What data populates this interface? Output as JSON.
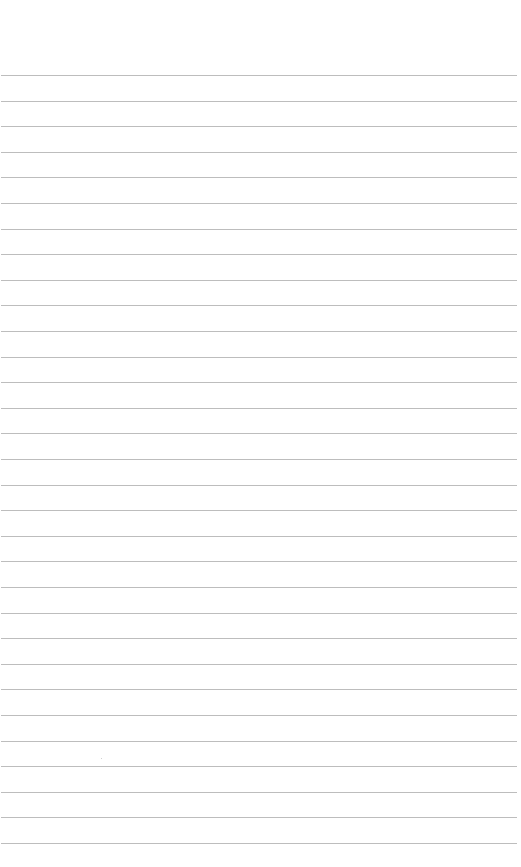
{
  "page": {
    "type": "lined-paper",
    "background_color": "#ffffff",
    "rule_color": "#bdbdbd",
    "rule_count": 31,
    "first_rule_y": 75,
    "rule_spacing_px": 25.6,
    "rule_left_x": 1,
    "rule_right_x": 517
  }
}
